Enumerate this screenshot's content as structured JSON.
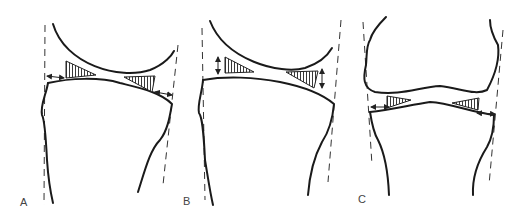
{
  "figure": {
    "panels": [
      {
        "id": "A",
        "label": "A",
        "description": "Femoral condyle above tibial plateau; horizontal arrows at lateral gaps indicating lateral offset; hatched wedge-shaped gaps on both sides"
      },
      {
        "id": "B",
        "label": "B",
        "description": "Femoral condyle above tibial plateau; vertical double arrows indicating joint space height; hatched wedge-shaped gaps on both sides"
      },
      {
        "id": "C",
        "label": "C",
        "description": "Knee joint with femur and tibia; horizontal arrows at joint line margins; hatched wedge-shaped gaps on both sides"
      }
    ],
    "colors": {
      "line": "#1a1a1a",
      "dash": "#333333",
      "label": "#444444",
      "background": "#ffffff"
    }
  }
}
